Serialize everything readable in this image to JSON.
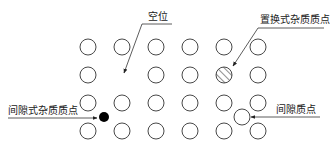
{
  "diagram": {
    "lattice": {
      "rows": 4,
      "cols": 6
    },
    "vacancy": {
      "row": 2,
      "col": 2
    },
    "substitutional": {
      "row": 2,
      "col": 5
    },
    "labels": {
      "vacancy": "空位",
      "substitutional": "置换式杂质质点",
      "interstitial_impurity": "间隙式杂质质点",
      "self_interstitial": "间隙质点"
    },
    "colors": {
      "line": "#333333",
      "impurity_fill": "#000000",
      "text": "#222222"
    }
  }
}
